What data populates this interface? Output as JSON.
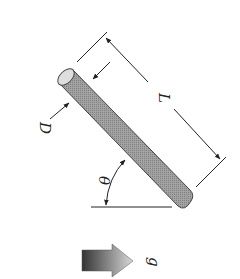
{
  "diagram": {
    "labels": {
      "diameter": "D",
      "length": "L",
      "angle": "θ",
      "gravity": "g"
    },
    "colors": {
      "rod_fill": "#9a9a9a",
      "rod_end": "#dcdcdc",
      "line": "#222222",
      "arrow_dark": "#333333",
      "arrow_light": "#cfcfcf"
    },
    "orientation": "rotated 90 degrees clockwise"
  }
}
